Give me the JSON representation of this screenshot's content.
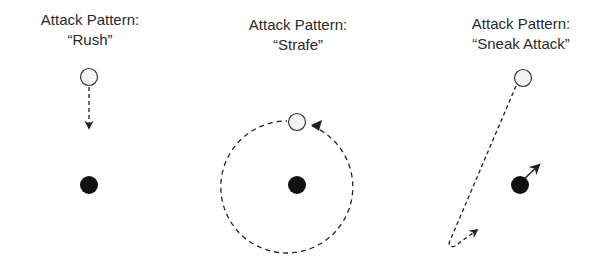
{
  "panels": [
    {
      "heading": "Attack Pattern:",
      "name": "“Rush”"
    },
    {
      "heading": "Attack Pattern:",
      "name": "“Strafe”"
    },
    {
      "heading": "Attack Pattern:",
      "name": "“Sneak Attack”"
    }
  ],
  "legend": {
    "attacker": "open-circle",
    "target": "filled-circle",
    "path": "dashed-arrow"
  },
  "colors": {
    "stroke": "#222222",
    "attacker_fill": "#f4f4f4",
    "target_fill": "#111111"
  }
}
